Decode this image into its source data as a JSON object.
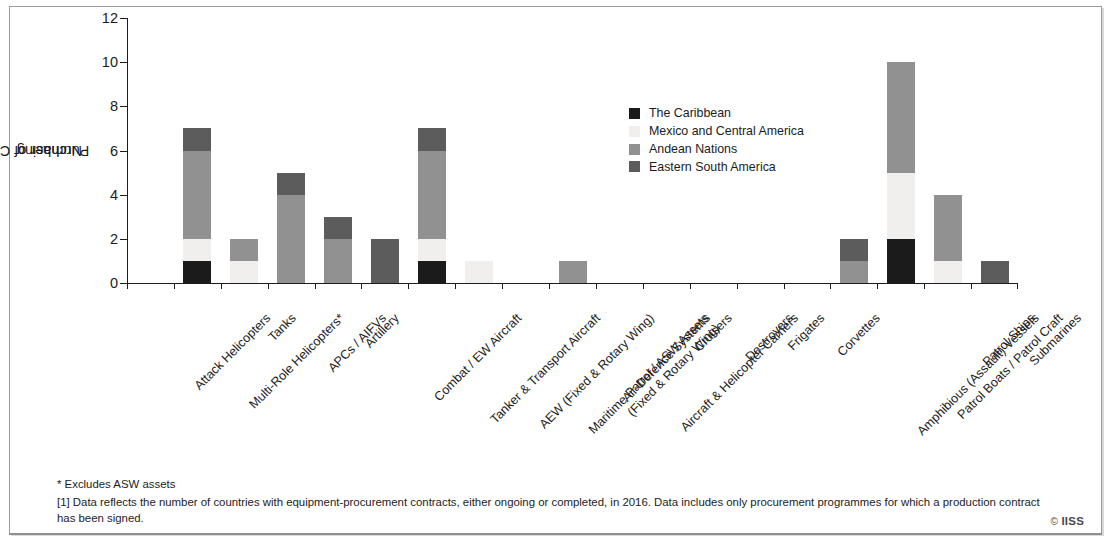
{
  "chart_data": {
    "type": "bar",
    "subtype": "stacked-vertical",
    "title": "",
    "xlabel": "",
    "ylabel": "Number of Countries Purchasing",
    "ylim": [
      0,
      12
    ],
    "ytick_values": [
      0,
      2,
      4,
      6,
      8,
      10,
      12
    ],
    "ytick_labels": [
      "0",
      "2",
      "4",
      "6",
      "8",
      "10",
      "12"
    ],
    "grid": false,
    "legend_position": "inside-upper-right",
    "categories": [
      "Attack Helicopters",
      "Multi-Role Helicopters*",
      "Tanks",
      "APCs / AIFVs",
      "Artillery",
      "Combat / EW Aircraft",
      "Tanker & Transport Aircraft",
      "AEW (Fixed & Rotary Wing)",
      "Maritime Patrol / ASW Assets\n(Fixed & Rotary Wing)",
      "Air-Defence Systems",
      "Aircraft & Helicopter Carriers",
      "Cruisers",
      "Destroyers",
      "Frigates",
      "Corvettes",
      "Amphibious (Assault) Vessels",
      "Patrol Boats / Patrol Craft",
      "Patrol Ships",
      "Submarines"
    ],
    "series": [
      {
        "name": "The Caribbean",
        "color": "#1b1b1b",
        "values": [
          0,
          1,
          0,
          0,
          0,
          0,
          1,
          0,
          0,
          0,
          0,
          0,
          0,
          0,
          0,
          0,
          2,
          0,
          0
        ]
      },
      {
        "name": "Mexico and Central America",
        "color": "#f0efed",
        "values": [
          0,
          1,
          1,
          0,
          0,
          0,
          1,
          1,
          0,
          0,
          0,
          0,
          0,
          0,
          0,
          0,
          3,
          1,
          0
        ]
      },
      {
        "name": "Andean Nations",
        "color": "#919191",
        "values": [
          0,
          4,
          1,
          4,
          2,
          0,
          4,
          0,
          0,
          1,
          0,
          0,
          0,
          0,
          0,
          1,
          5,
          3,
          0
        ]
      },
      {
        "name": "Eastern South America",
        "color": "#5c5c5c",
        "values": [
          0,
          1,
          0,
          1,
          1,
          2,
          1,
          0,
          0,
          0,
          0,
          0,
          0,
          0,
          0,
          1,
          0,
          0,
          1
        ]
      }
    ],
    "totals": [
      0,
      7,
      2,
      5,
      3,
      2,
      7,
      1,
      0,
      1,
      0,
      0,
      0,
      0,
      0,
      2,
      10,
      4,
      1
    ]
  },
  "legend": {
    "items": [
      {
        "label": "The Caribbean",
        "color": "#1b1b1b"
      },
      {
        "label": "Mexico and Central America",
        "color": "#f0efed"
      },
      {
        "label": "Andean Nations",
        "color": "#919191"
      },
      {
        "label": "Eastern South America",
        "color": "#5c5c5c"
      }
    ]
  },
  "axes": {
    "y_title_line1": "Number of Countries",
    "y_title_line2": "Purchasing"
  },
  "notes": {
    "asterisk": "* Excludes ASW assets",
    "footnote": "[1] Data reflects the number of countries with equipment-procurement contracts, either ongoing or completed, in 2016. Data includes only procurement programmes for which a production contract has been signed."
  },
  "credit": {
    "mark": "©",
    "text": "IISS"
  }
}
